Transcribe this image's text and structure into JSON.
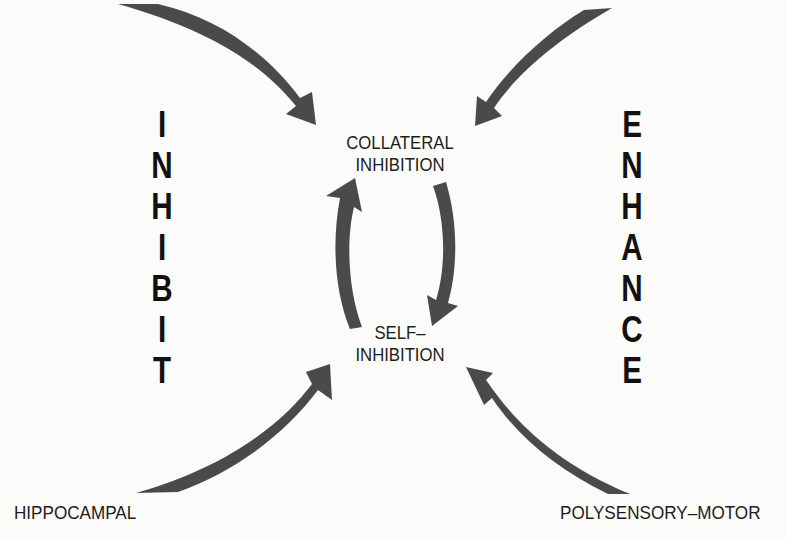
{
  "diagram": {
    "nodes": {
      "collateral": {
        "line1": "COLLATERAL",
        "line2": "INHIBITION"
      },
      "self": {
        "line1": "SELF–",
        "line2": "INHIBITION"
      }
    },
    "side_words": {
      "left": {
        "word": "INHIBIT",
        "letters": [
          "I",
          "N",
          "H",
          "I",
          "B",
          "I",
          "T"
        ]
      },
      "right": {
        "word": "ENHANCE",
        "letters": [
          "E",
          "N",
          "H",
          "A",
          "N",
          "C",
          "E"
        ]
      }
    },
    "sources": {
      "bottom_left": "HIPPOCAMPAL",
      "bottom_right": "POLYSENSORY–MOTOR"
    },
    "arrows": [
      {
        "from": "top-left",
        "to": "collateral-inhibition"
      },
      {
        "from": "top-right",
        "to": "collateral-inhibition"
      },
      {
        "from": "collateral-inhibition",
        "to": "self-inhibition"
      },
      {
        "from": "self-inhibition",
        "to": "collateral-inhibition"
      },
      {
        "from": "hippocampal",
        "to": "self-inhibition"
      },
      {
        "from": "polysensory-motor",
        "to": "self-inhibition"
      }
    ],
    "colors": {
      "arrow": "#4a4a4a",
      "text": "#1a1a1a",
      "background": "#fbfbfa"
    }
  }
}
